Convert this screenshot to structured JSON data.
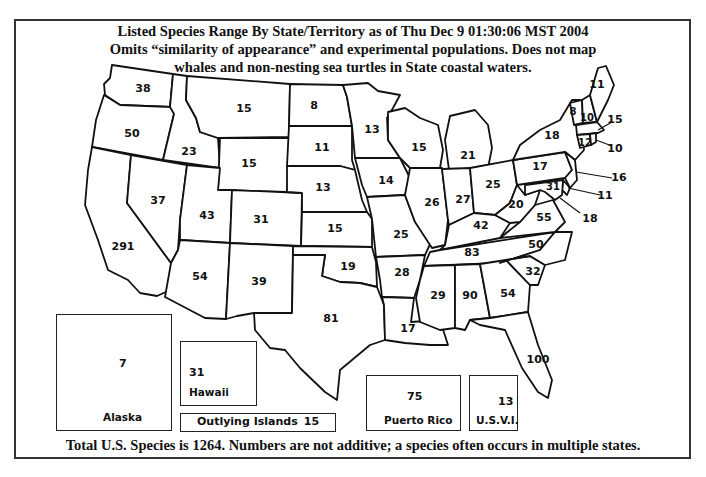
{
  "title": {
    "line1": "Listed Species Range By State/Territory as of Thu Dec 9 01:30:06 MST 2004",
    "line2": "Omits “similarity of appearance” and experimental populations. Does not map",
    "line3": "whales and non-nesting sea turtles in State coastal waters."
  },
  "footer": "Total U.S. Species is 1264. Numbers are not additive; a species often occurs in multiple states.",
  "colors": {
    "border": "#111111",
    "background": "#ffffff"
  },
  "states": {
    "WA": "38",
    "OR": "50",
    "CA": "291",
    "ID": "23",
    "NV": "37",
    "MT": "15",
    "WY": "15",
    "UT": "43",
    "AZ": "54",
    "CO": "31",
    "NM": "39",
    "ND": "8",
    "SD": "11",
    "NE": "13",
    "KS": "15",
    "OK": "19",
    "TX": "81",
    "MN": "13",
    "IA": "14",
    "MO": "25",
    "AR": "28",
    "LA": "17",
    "WI": "15",
    "IL": "26",
    "MI": "21",
    "IN": "27",
    "OH": "25",
    "KY": "42",
    "TN": "83",
    "MS": "29",
    "AL": "90",
    "GA": "54",
    "FL": "100",
    "SC": "32",
    "NC": "50",
    "VA": "55",
    "WV": "20",
    "PA": "17",
    "NY": "18",
    "VT": "8",
    "NH": "10",
    "ME": "11",
    "MA": "15",
    "CT": "12",
    "RI": "10",
    "NJ": "16",
    "DE": "11",
    "MD": "31",
    "DC": "18"
  },
  "insets": {
    "alaska": {
      "name": "Alaska",
      "value": "7"
    },
    "hawaii": {
      "name": "Hawaii",
      "value": "31"
    },
    "outlying": {
      "name": "Outlying Islands",
      "value": "15"
    },
    "puerto_rico": {
      "name": "Puerto Rico",
      "value": "75"
    },
    "usvi": {
      "name": "U.S.V.I.",
      "value": "13"
    }
  }
}
